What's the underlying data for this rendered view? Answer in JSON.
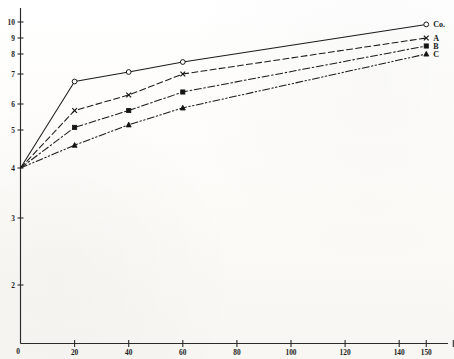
{
  "chart_data": {
    "type": "line",
    "title": "",
    "subtitle": "",
    "xlabel": "",
    "ylabel": "",
    "xlim": [
      0,
      160
    ],
    "ylim": [
      0,
      10
    ],
    "grid": false,
    "legend_position": "right-of-line-ends",
    "x_ticks": [
      {
        "value": 0,
        "label": "0"
      },
      {
        "value": 20,
        "label": "20"
      },
      {
        "value": 40,
        "label": "40"
      },
      {
        "value": 60,
        "label": "60"
      },
      {
        "value": 80,
        "label": "80"
      },
      {
        "value": 100,
        "label": "100"
      },
      {
        "value": 120,
        "label": "120"
      },
      {
        "value": 140,
        "label": "140"
      },
      {
        "value": 150,
        "label": "150"
      }
    ],
    "x_minor_ticks": [
      160
    ],
    "y_ticks": [
      {
        "value": 2,
        "label": "2"
      },
      {
        "value": 3,
        "label": "3"
      },
      {
        "value": 4,
        "label": "4"
      },
      {
        "value": 5,
        "label": "5"
      },
      {
        "value": 6,
        "label": "6"
      },
      {
        "value": 7,
        "label": "7"
      },
      {
        "value": 8,
        "label": "8"
      },
      {
        "value": 9,
        "label": "9"
      },
      {
        "value": 10,
        "label": "10"
      }
    ],
    "y_origin_label": "0",
    "x": [
      0,
      20,
      40,
      60,
      150
    ],
    "series": [
      {
        "name": "Co.",
        "label": "Co.",
        "marker": "open-circle",
        "line_style": "solid",
        "color": "#1b1b1b",
        "values": [
          4.0,
          6.75,
          7.1,
          7.6,
          9.85
        ]
      },
      {
        "name": "A",
        "label": "A",
        "marker": "cross",
        "line_style": "dashed",
        "color": "#1b1b1b",
        "values": [
          4.0,
          5.75,
          6.3,
          7.0,
          9.0
        ]
      },
      {
        "name": "B",
        "label": "B",
        "marker": "filled-square",
        "line_style": "dash-dot",
        "color": "#1b1b1b",
        "values": [
          4.0,
          5.1,
          5.75,
          6.4,
          8.5
        ]
      },
      {
        "name": "C",
        "label": "C",
        "marker": "filled-triangle",
        "line_style": "dash-dot-dot",
        "color": "#1b1b1b",
        "values": [
          4.0,
          4.6,
          5.2,
          5.85,
          8.0
        ]
      }
    ]
  },
  "figure": {
    "ink_color": "#1b1b1b",
    "paper_color": "#fdfdfb"
  }
}
